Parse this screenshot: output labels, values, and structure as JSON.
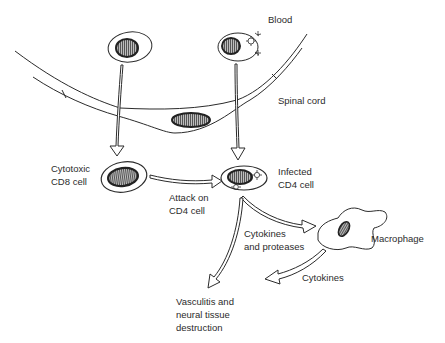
{
  "figure": {
    "labels": {
      "blood": "Blood",
      "spinal_cord": "Spinal cord",
      "cd8_line1": "Cytotoxic",
      "cd8_line2": "CD8 cell",
      "attack_line1": "Attack on",
      "attack_line2": "CD4 cell",
      "infected_line1": "Infected",
      "infected_line2": "CD4 cell",
      "cyto_prot_line1": "Cytokines",
      "cyto_prot_line2": "and proteases",
      "macrophage": "Macrophage",
      "cytokines": "Cytokines",
      "vasc_line1": "Vasculitis and",
      "vasc_line2": "neural tissue",
      "vasc_line3": "destruction"
    },
    "nodes": [
      {
        "id": "cd8-blood",
        "type": "lymphocyte",
        "location": "blood"
      },
      {
        "id": "cd4-infected-blood",
        "type": "lymphocyte",
        "location": "blood",
        "virions": true
      },
      {
        "id": "endothelial-cell",
        "type": "endothelial",
        "location": "vessel wall"
      },
      {
        "id": "cd8-cord",
        "type": "lymphocyte",
        "label": "Cytotoxic CD8 cell"
      },
      {
        "id": "cd4-cord",
        "type": "lymphocyte",
        "label": "Infected CD4 cell",
        "virions": true
      },
      {
        "id": "macrophage",
        "type": "macrophage",
        "label": "Macrophage"
      },
      {
        "id": "outcome",
        "type": "text",
        "label": "Vasculitis and neural tissue destruction"
      }
    ],
    "edges": [
      {
        "from": "cd8-blood",
        "to": "cd8-cord",
        "label": ""
      },
      {
        "from": "cd4-infected-blood",
        "to": "cd4-cord",
        "label": ""
      },
      {
        "from": "cd8-cord",
        "to": "cd4-cord",
        "label": "Attack on CD4 cell"
      },
      {
        "from": "cd4-cord",
        "to": "macrophage",
        "label": "Cytokines and proteases"
      },
      {
        "from": "cd4-cord",
        "to": "outcome",
        "label": ""
      },
      {
        "from": "macrophage",
        "to": "outcome",
        "label": "Cytokines"
      }
    ],
    "colors": {
      "line": "#2b2b2b",
      "nucleus_fill": "#8a8a8a",
      "background": "#ffffff"
    }
  }
}
